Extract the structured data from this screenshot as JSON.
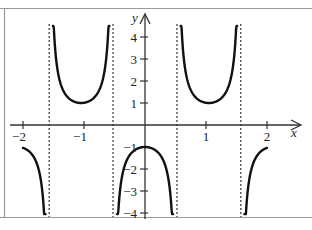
{
  "chart_data": {
    "type": "line",
    "title": "",
    "function": "y = -sec(3x)",
    "xlabel": "x",
    "ylabel": "y",
    "xlim": [
      -2,
      2
    ],
    "ylim": [
      -4,
      4
    ],
    "x_ticks": [
      -2,
      -1,
      1,
      2
    ],
    "x_tick_labels": [
      "−2",
      "−1",
      "1",
      "2"
    ],
    "y_ticks": [
      4,
      3,
      2,
      1,
      -1,
      -2,
      -3,
      -4
    ],
    "y_tick_labels": [
      "4",
      "3",
      "2",
      "1",
      "−1",
      "−2",
      "−3",
      "−4"
    ],
    "asymptotes_x": [
      -1.571,
      -0.524,
      0.524,
      1.571
    ],
    "grid": false,
    "legend": null,
    "series": [
      {
        "name": "branch-left-down",
        "x": [
          -2.0,
          -1.9,
          -1.8,
          -1.7,
          -1.65,
          -1.63
        ],
        "y": [
          -1.04,
          -1.2,
          -1.6,
          -2.6,
          -3.7,
          -4.0
        ]
      },
      {
        "name": "branch-left-up",
        "x": [
          -1.51,
          -1.45,
          -1.3,
          -1.15,
          -1.047,
          -0.95,
          -0.8,
          -0.64,
          -0.585
        ],
        "y": [
          4.5,
          2.7,
          1.42,
          1.1,
          1.0,
          1.04,
          1.35,
          2.9,
          4.5
        ]
      },
      {
        "name": "branch-center-down",
        "x": [
          -0.46,
          -0.4,
          -0.3,
          -0.2,
          0.0,
          0.2,
          0.3,
          0.4,
          0.46
        ],
        "y": [
          -4.0,
          -2.8,
          -1.6,
          -1.21,
          -1.0,
          -1.21,
          -1.6,
          -2.8,
          -4.0
        ]
      },
      {
        "name": "branch-right-up",
        "x": [
          0.585,
          0.64,
          0.8,
          0.95,
          1.047,
          1.15,
          1.3,
          1.45,
          1.51
        ],
        "y": [
          4.5,
          2.9,
          1.35,
          1.04,
          1.0,
          1.1,
          1.42,
          2.7,
          4.5
        ]
      },
      {
        "name": "branch-right-down",
        "x": [
          1.63,
          1.65,
          1.7,
          1.8,
          1.9,
          2.0
        ],
        "y": [
          -4.0,
          -3.7,
          -2.6,
          -1.6,
          -1.2,
          -1.04
        ]
      }
    ]
  },
  "axes": {
    "x_label": "x",
    "y_label": "y",
    "x_tick_labels": [
      "−2",
      "−1",
      "1",
      "2"
    ],
    "y_tick_labels": [
      "4",
      "3",
      "2",
      "1",
      "−1",
      "−2",
      "−3",
      "−4"
    ]
  }
}
